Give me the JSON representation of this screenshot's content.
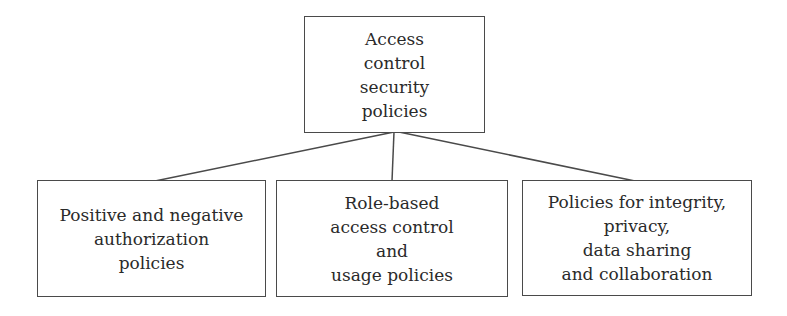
{
  "diagram": {
    "type": "tree",
    "root": {
      "label": "Access\ncontrol\nsecurity\npolicies"
    },
    "children": [
      {
        "label": "Positive and negative\nauthorization\npolicies"
      },
      {
        "label": "Role-based\naccess control\nand\nusage policies"
      },
      {
        "label": "Policies for integrity,\nprivacy,\ndata sharing\nand collaboration"
      }
    ],
    "edges": [
      {
        "from": "root",
        "to": "children.0"
      },
      {
        "from": "root",
        "to": "children.1"
      },
      {
        "from": "root",
        "to": "children.2"
      }
    ],
    "colors": {
      "stroke": "#4a4a4a",
      "text": "#2a2a2a",
      "background": "#ffffff"
    }
  }
}
